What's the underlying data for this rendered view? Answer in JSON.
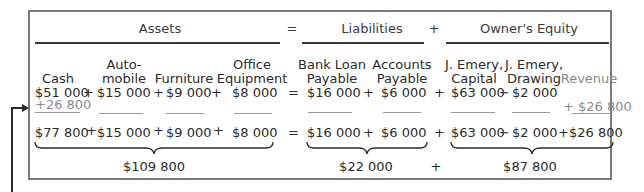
{
  "headers": {
    "assets": "Assets",
    "equals": "=",
    "liabilities": "Liabilities",
    "plus": "+",
    "owners_equity": "Owner's Equity"
  },
  "columns": [
    {
      "label_line1": "",
      "label_line2": "Cash",
      "before": "$51 000",
      "change": "+26 800",
      "after": "$77 800"
    },
    {
      "label_line1": "Auto-",
      "label_line2": "mobile",
      "before": "$15 000",
      "change": "",
      "after": "$15 000"
    },
    {
      "label_line1": "",
      "label_line2": "Furniture",
      "before": "$9 000",
      "change": "",
      "after": "$9 000"
    },
    {
      "label_line1": "Office",
      "label_line2": "Equipment",
      "before": "$8 000",
      "change": "",
      "after": "$8 000"
    },
    {
      "label_line1": "Bank Loan",
      "label_line2": "Payable",
      "before": "$16 000",
      "change": "",
      "after": "$16 000"
    },
    {
      "label_line1": "Accounts",
      "label_line2": "Payable",
      "before": "$6 000",
      "change": "",
      "after": "$6 000"
    },
    {
      "label_line1": "J. Emery,",
      "label_line2": "Capital",
      "before": "$63 000",
      "change": "",
      "after": "$63 000"
    },
    {
      "label_line1": "J. Emery,",
      "label_line2": "Drawing",
      "before": "$2 000",
      "change": "",
      "after": "$2 000"
    },
    {
      "label_line1": "",
      "label_line2": "Revenue",
      "before": "",
      "change": "+ $26 800",
      "after": "$26 800"
    }
  ],
  "operators": {
    "before_row": [
      "+",
      "+",
      "+",
      "=",
      "+",
      "+",
      "−"
    ],
    "after_row": [
      "+",
      "+",
      "+",
      "=",
      "+",
      "+",
      "−",
      "+"
    ]
  },
  "totals": {
    "assets": "$109 800",
    "liabilities": "$22 000",
    "plus": "+",
    "owners_equity": "$87 800"
  },
  "colors": {
    "text": "#2b2b2b",
    "change_text": "#8a8a8a",
    "border": "#7a7a7a"
  }
}
